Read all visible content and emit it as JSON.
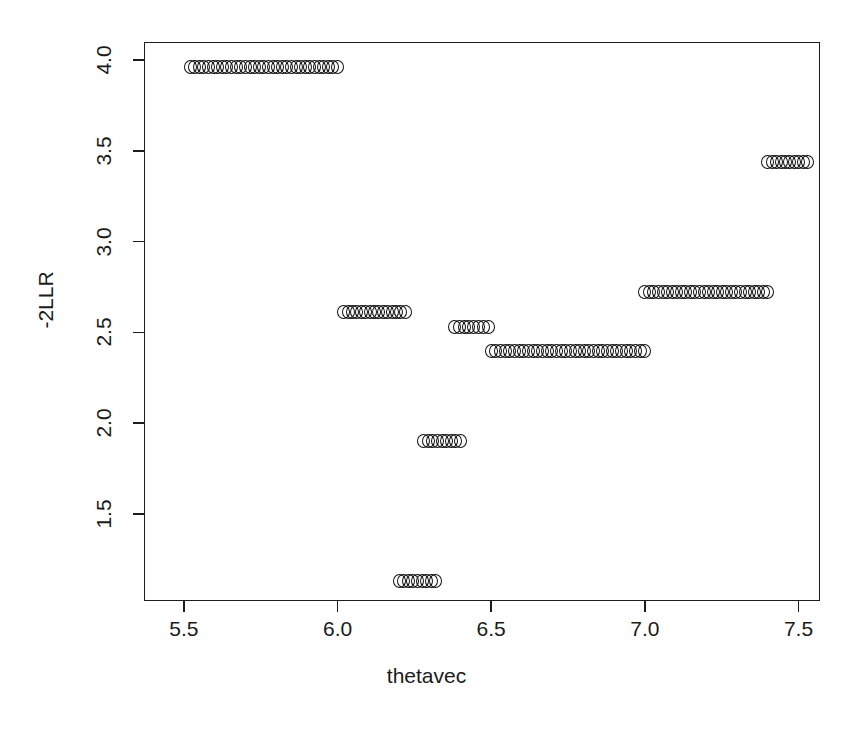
{
  "chart_data": {
    "type": "scatter",
    "title": "",
    "xlabel": "thetavec",
    "ylabel": "-2LLR",
    "xlim": [
      5.37,
      7.57
    ],
    "ylim": [
      1.02,
      4.1
    ],
    "xticks": [
      "5.5",
      "6.0",
      "6.5",
      "7.0",
      "7.5"
    ],
    "xtick_values": [
      5.5,
      6.0,
      6.5,
      7.0,
      7.5
    ],
    "yticks": [
      "1.5",
      "2.0",
      "2.5",
      "3.0",
      "3.5",
      "4.0"
    ],
    "ytick_values": [
      1.5,
      2.0,
      2.5,
      3.0,
      3.5,
      4.0
    ],
    "grid": false,
    "legend": null,
    "marker": "open-circle",
    "marker_color": "#111111",
    "segments": [
      {
        "y": 3.96,
        "x_start": 5.52,
        "x_end": 6.0,
        "n": 33
      },
      {
        "y": 2.61,
        "x_start": 6.02,
        "x_end": 6.22,
        "n": 15
      },
      {
        "y": 1.13,
        "x_start": 6.2,
        "x_end": 6.32,
        "n": 9
      },
      {
        "y": 1.9,
        "x_start": 6.28,
        "x_end": 6.4,
        "n": 9
      },
      {
        "y": 2.53,
        "x_start": 6.38,
        "x_end": 6.49,
        "n": 8
      },
      {
        "y": 2.4,
        "x_start": 6.5,
        "x_end": 7.0,
        "n": 34
      },
      {
        "y": 2.72,
        "x_start": 7.0,
        "x_end": 7.4,
        "n": 28
      },
      {
        "y": 3.44,
        "x_start": 7.4,
        "x_end": 7.53,
        "n": 10
      }
    ]
  },
  "colors": {
    "axis": "#1c1c1c",
    "marker": "#111111",
    "background": "#ffffff"
  }
}
